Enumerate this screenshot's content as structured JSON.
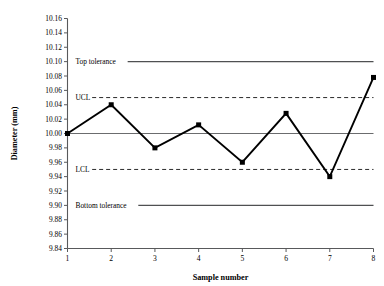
{
  "chart_data": {
    "type": "line",
    "title": "",
    "xlabel": "Sample number",
    "ylabel": "Diameter (mm)",
    "x": [
      1,
      2,
      3,
      4,
      5,
      6,
      7,
      8
    ],
    "categories": [
      "1",
      "2",
      "3",
      "4",
      "5",
      "6",
      "7",
      "8"
    ],
    "values": [
      10.0,
      10.04,
      9.98,
      10.012,
      9.96,
      10.028,
      9.94,
      10.078
    ],
    "series": [
      {
        "name": "Diameter",
        "values": [
          10.0,
          10.04,
          9.98,
          10.012,
          9.96,
          10.028,
          9.94,
          10.078
        ],
        "marker": "square",
        "color": "#000000"
      }
    ],
    "ylim": [
      9.84,
      10.16
    ],
    "xlim": [
      1,
      8
    ],
    "ytick_step": 0.02,
    "ytick_labels": [
      "10.16",
      "10.14",
      "10.12",
      "10.10",
      "10.08",
      "10.06",
      "10.04",
      "10.02",
      "10.00",
      "9.98",
      "9.96",
      "9.94",
      "9.92",
      "9.90",
      "9.88",
      "9.86",
      "9.84"
    ],
    "ytick_values": [
      10.16,
      10.14,
      10.12,
      10.1,
      10.08,
      10.06,
      10.04,
      10.02,
      10.0,
      9.98,
      9.96,
      9.94,
      9.92,
      9.9,
      9.88,
      9.86,
      9.84
    ],
    "grid": false,
    "legend": "none",
    "reference_lines": [
      {
        "label": "Top tolerance",
        "value": 10.1,
        "style": "solid",
        "color": "#4f5052"
      },
      {
        "label": "UCL",
        "value": 10.05,
        "style": "dashed",
        "color": "#2b2b2b"
      },
      {
        "label": "",
        "value": 10.0,
        "style": "solid-thin",
        "color": "#6b6c6e"
      },
      {
        "label": "LCL",
        "value": 9.95,
        "style": "dashed",
        "color": "#2b2b2b"
      },
      {
        "label": "Bottom tolerance",
        "value": 9.9,
        "style": "solid",
        "color": "#4f5052"
      }
    ]
  }
}
